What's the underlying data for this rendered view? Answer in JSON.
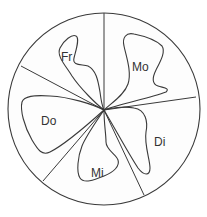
{
  "diagram": {
    "type": "polar-sector-loops",
    "sectors": [
      {
        "id": "mo",
        "label": "Mo"
      },
      {
        "id": "di",
        "label": "Di"
      },
      {
        "id": "mi",
        "label": "Mi"
      },
      {
        "id": "do",
        "label": "Do"
      },
      {
        "id": "fr",
        "label": "Fr"
      }
    ],
    "colors": {
      "stroke": "#3a3a3a",
      "background": "#ffffff",
      "text": "#333333"
    }
  }
}
